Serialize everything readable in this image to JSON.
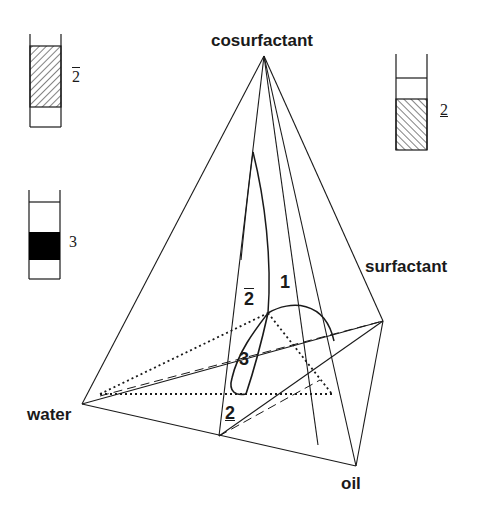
{
  "diagram": {
    "type": "phase-prism-schematic",
    "components": {
      "top": "cosurfactant",
      "left": "water",
      "right": "surfactant",
      "bottom": "oil"
    },
    "regions": [
      {
        "id": "1",
        "label": "1"
      },
      {
        "id": "2bar",
        "label": "2",
        "mark": "overbar"
      },
      {
        "id": "2under",
        "label": "2",
        "mark": "underbar"
      },
      {
        "id": "3",
        "label": "3"
      }
    ],
    "tubes": [
      {
        "id": "tube-2bar",
        "label": "2",
        "mark": "overbar",
        "description": "lower phase microemulsion (hatched lower region)"
      },
      {
        "id": "tube-2under",
        "label": "2",
        "mark": "underbar",
        "description": "hatched lower region, clear upper"
      },
      {
        "id": "tube-3",
        "label": "3",
        "description": "middle black phase"
      }
    ],
    "colors": {
      "line": "#1a1a1a",
      "background": "#ffffff",
      "fill_dark": "#000000"
    }
  }
}
